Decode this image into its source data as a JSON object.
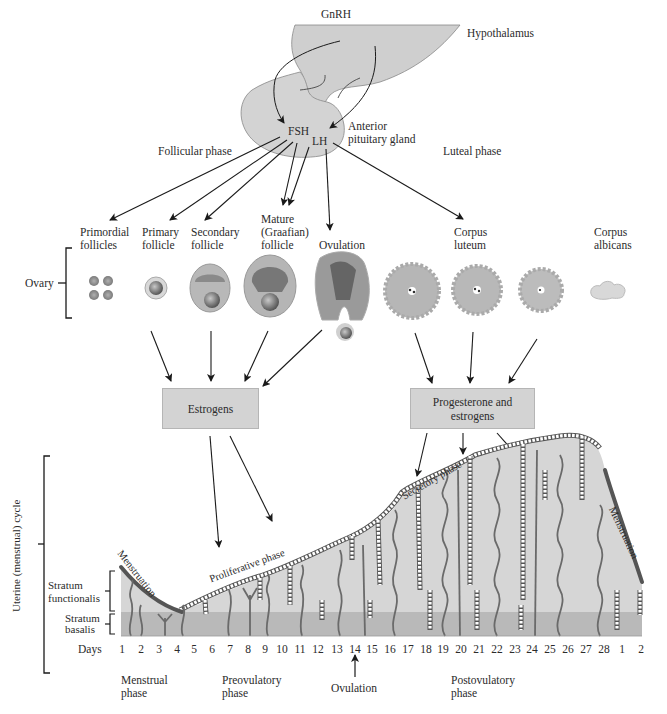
{
  "hypothalamus": {
    "label": "Hypothalamus",
    "hormone": "GnRH"
  },
  "pituitary": {
    "label_line1": "Anterior",
    "label_line2": "pituitary gland",
    "fsh": "FSH",
    "lh": "LH"
  },
  "phases_top": {
    "follicular": "Follicular phase",
    "luteal": "Luteal phase"
  },
  "ovary": {
    "label": "Ovary",
    "stages": [
      {
        "line1": "Primordial",
        "line2": "follicles"
      },
      {
        "line1": "Primary",
        "line2": "follicle"
      },
      {
        "line1": "Secondary",
        "line2": "follicle"
      },
      {
        "line1": "Mature",
        "line2": "(Graafian)",
        "line3": "follicle"
      },
      {
        "line1": "Ovulation"
      },
      {
        "line1": "Corpus",
        "line2": "luteum"
      },
      {
        "line1": "Corpus",
        "line2": "albicans"
      }
    ]
  },
  "hormone_boxes": {
    "estrogens": "Estrogens",
    "progesterone_line1": "Progesterone and",
    "progesterone_line2": "estrogens"
  },
  "uterus": {
    "cycle_label": "Uterine (menstrual) cycle",
    "stratum_functionalis_line1": "Stratum",
    "stratum_functionalis_line2": "functionalis",
    "stratum_basalis_line1": "Stratum",
    "stratum_basalis_line2": "basalis",
    "menstruation_left": "Menstruation",
    "proliferative": "Proliferative phase",
    "secretory": "Secretory phase",
    "menstruation_right": "Menstruation"
  },
  "days": {
    "label": "Days",
    "values": [
      "1",
      "2",
      "3",
      "4",
      "5",
      "6",
      "7",
      "8",
      "9",
      "10",
      "11",
      "12",
      "13",
      "14",
      "15",
      "16",
      "17",
      "18",
      "19",
      "20",
      "21",
      "22",
      "23",
      "24",
      "25",
      "26",
      "27",
      "28",
      "1",
      "2"
    ]
  },
  "phases_bottom": {
    "menstrual_line1": "Menstrual",
    "menstrual_line2": "phase",
    "preovulatory_line1": "Preovulatory",
    "preovulatory_line2": "phase",
    "ovulation": "Ovulation",
    "postovulatory_line1": "Postovulatory",
    "postovulatory_line2": "phase"
  },
  "colors": {
    "tissue_gray": "#d4d4d4",
    "basalis_gray": "#b8b8b8",
    "vessel_dark": "#6a6a6a",
    "box_fill": "#d3d3d3",
    "line": "#1a1a1a"
  }
}
